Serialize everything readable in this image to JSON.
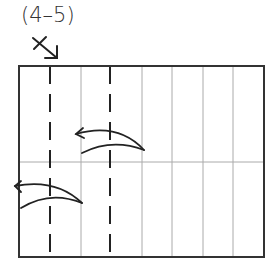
{
  "diagram": {
    "step_label": "(4–5)",
    "symbol": "x-arrow-mark",
    "paper": {
      "x": 19,
      "y": 66,
      "width": 245,
      "height": 191,
      "columns": 8,
      "horizontal_crease_y": 162,
      "valley_fold_columns": [
        1,
        3
      ]
    },
    "arrows": [
      {
        "name": "fold-arrow-upper",
        "direction": "left"
      },
      {
        "name": "fold-arrow-lower",
        "direction": "left"
      }
    ],
    "colors": {
      "ink": "#222222",
      "crease": "#aaaaaa",
      "outline": "#333333"
    }
  }
}
